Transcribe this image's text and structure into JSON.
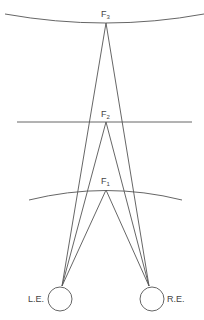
{
  "diagram": {
    "title": "",
    "fixation_points": [
      {
        "id": "F3",
        "label": "F",
        "subscript": "3",
        "surface": "arc"
      },
      {
        "id": "F2",
        "label": "F",
        "subscript": "2",
        "surface": "line"
      },
      {
        "id": "F1",
        "label": "F",
        "subscript": "1",
        "surface": "arc"
      }
    ],
    "eyes": [
      {
        "id": "left",
        "label": "L.E."
      },
      {
        "id": "right",
        "label": "R.E."
      }
    ],
    "colors": {
      "line": "#555555",
      "background": "#ffffff"
    }
  }
}
